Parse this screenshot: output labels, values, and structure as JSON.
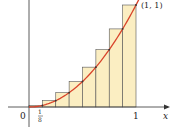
{
  "diagram": {
    "type": "riemann-sum",
    "function": "y = x^2",
    "interval": [
      0,
      1
    ],
    "n": 8,
    "method": "right-endpoint",
    "labels": {
      "origin": "0",
      "x_axis": "x",
      "tick_one": "1",
      "tick_eighth_num": "1",
      "tick_eighth_den": "8",
      "point": "(1, 1)"
    },
    "colors": {
      "curve": "#d9442b",
      "rect_fill": "#fbeec2",
      "rect_stroke": "#555555",
      "axis": "#333333"
    }
  },
  "chart_data": {
    "type": "bar",
    "title": "",
    "xlabel": "x",
    "ylabel": "",
    "categories": [
      "1/8",
      "2/8",
      "3/8",
      "4/8",
      "5/8",
      "6/8",
      "7/8",
      "1"
    ],
    "values": [
      0.015625,
      0.0625,
      0.140625,
      0.25,
      0.390625,
      0.5625,
      0.765625,
      1.0
    ],
    "overlay_curve": "y = x^2",
    "annotations": [
      "(1, 1)",
      "0",
      "1/8",
      "1"
    ],
    "xlim": [
      0,
      1
    ],
    "ylim": [
      0,
      1
    ]
  }
}
